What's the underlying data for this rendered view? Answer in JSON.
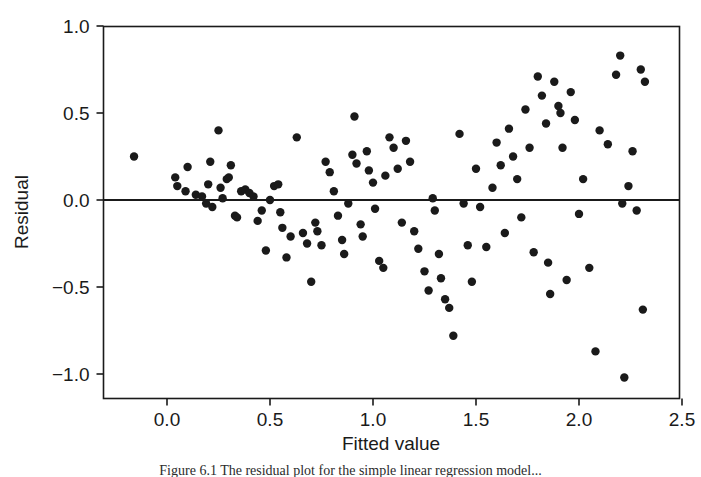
{
  "figure": {
    "caption": "Figure 6.1   The residual plot for the simple linear regression model..."
  },
  "chart_data": {
    "type": "scatter",
    "title": "",
    "xlabel": "Fitted value",
    "ylabel": "Residual",
    "xlim": [
      -0.32,
      2.68
    ],
    "ylim": [
      -1.14,
      1.0
    ],
    "xticks": [
      0.0,
      0.5,
      1.0,
      1.5,
      2.0,
      2.5
    ],
    "xticklabels": [
      "0.0",
      "0.5",
      "1.0",
      "1.5",
      "2.0",
      "2.5"
    ],
    "yticks": [
      -1.0,
      -0.5,
      0.0,
      0.5,
      1.0
    ],
    "yticklabels": [
      "−1.0",
      "−0.5",
      "0.0",
      "0.5",
      "1.0"
    ],
    "grid": false,
    "legend": null,
    "reference_lines": [
      {
        "orientation": "horizontal",
        "value": 0.0,
        "color": "#1a1a1a"
      }
    ],
    "marker": {
      "shape": "circle",
      "color": "#1a1a1a",
      "size": 6
    },
    "x": [
      -0.16,
      0.04,
      0.05,
      0.09,
      0.1,
      0.14,
      0.17,
      0.19,
      0.2,
      0.21,
      0.22,
      0.25,
      0.26,
      0.27,
      0.29,
      0.3,
      0.31,
      0.33,
      0.34,
      0.36,
      0.38,
      0.4,
      0.42,
      0.44,
      0.46,
      0.48,
      0.5,
      0.52,
      0.54,
      0.55,
      0.56,
      0.58,
      0.6,
      0.63,
      0.66,
      0.68,
      0.7,
      0.72,
      0.73,
      0.75,
      0.77,
      0.79,
      0.81,
      0.83,
      0.85,
      0.86,
      0.88,
      0.9,
      0.91,
      0.92,
      0.94,
      0.95,
      0.97,
      0.98,
      1.0,
      1.01,
      1.03,
      1.05,
      1.06,
      1.08,
      1.1,
      1.12,
      1.14,
      1.16,
      1.18,
      1.2,
      1.22,
      1.25,
      1.27,
      1.29,
      1.3,
      1.32,
      1.33,
      1.35,
      1.37,
      1.39,
      1.42,
      1.44,
      1.46,
      1.48,
      1.5,
      1.52,
      1.55,
      1.58,
      1.6,
      1.62,
      1.64,
      1.66,
      1.68,
      1.7,
      1.72,
      1.74,
      1.76,
      1.78,
      1.8,
      1.82,
      1.84,
      1.85,
      1.86,
      1.88,
      1.9,
      1.91,
      1.92,
      1.94,
      1.96,
      1.98,
      2.0,
      2.02,
      2.05,
      2.08,
      2.1,
      2.14,
      2.18,
      2.2,
      2.21,
      2.22,
      2.24,
      2.26,
      2.28,
      2.3,
      2.31,
      2.32
    ],
    "y": [
      0.25,
      0.13,
      0.08,
      0.05,
      0.19,
      0.03,
      0.02,
      -0.02,
      0.09,
      0.22,
      -0.04,
      0.4,
      0.07,
      0.01,
      0.12,
      0.13,
      0.2,
      -0.09,
      -0.1,
      0.05,
      0.06,
      0.04,
      0.02,
      -0.12,
      -0.06,
      -0.29,
      0.0,
      0.08,
      0.09,
      -0.07,
      -0.16,
      -0.33,
      -0.21,
      0.36,
      -0.19,
      -0.25,
      -0.47,
      -0.13,
      -0.18,
      -0.26,
      0.22,
      0.16,
      0.05,
      -0.09,
      -0.23,
      -0.31,
      -0.02,
      0.26,
      0.48,
      0.21,
      -0.14,
      -0.21,
      0.28,
      0.17,
      0.1,
      -0.05,
      -0.35,
      -0.39,
      0.14,
      0.36,
      0.3,
      0.18,
      -0.13,
      0.34,
      0.22,
      -0.18,
      -0.28,
      -0.41,
      -0.52,
      0.01,
      -0.06,
      -0.31,
      -0.45,
      -0.57,
      -0.62,
      -0.78,
      0.38,
      -0.02,
      -0.26,
      -0.47,
      0.18,
      -0.04,
      -0.27,
      0.07,
      0.33,
      0.2,
      -0.19,
      0.41,
      0.25,
      0.12,
      -0.1,
      0.52,
      0.3,
      -0.3,
      0.71,
      0.6,
      0.44,
      -0.36,
      -0.54,
      0.68,
      0.54,
      0.5,
      0.3,
      -0.46,
      0.62,
      0.46,
      -0.08,
      0.12,
      -0.39,
      -0.87,
      0.4,
      0.32,
      0.72,
      0.83,
      -0.02,
      -1.02,
      0.08,
      0.28,
      -0.06,
      0.75,
      -0.63,
      0.68
    ]
  },
  "axes": {
    "x_axis_name": "x-axis",
    "y_axis_name": "y-axis"
  }
}
